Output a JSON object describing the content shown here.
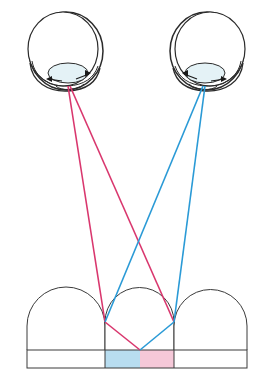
{
  "figure": {
    "background_color": "#ffffff",
    "width": 270,
    "height": 381
  },
  "colors": {
    "left_eye_ray": "#d9376e",
    "right_eye_ray": "#2a9ad6",
    "outline": "#3a3a3a",
    "eye_outline": "#2b2b2b",
    "lens_fill": "#e4f2f6",
    "left_region_fill": "#b8ddf0",
    "right_region_fill": "#f5c8d8",
    "arrow": "#1a1a1a"
  },
  "eyes": [
    {
      "id": "left-eye",
      "label": "left eye",
      "center_x": 64,
      "center_y": 50,
      "radius_x": 37,
      "radius_y": 40,
      "pupil_x": 68,
      "pupil_y": 72,
      "lens_rx": 20,
      "lens_ry": 10,
      "ray_origin_x": 68,
      "ray_origin_y": 86
    },
    {
      "id": "right-eye",
      "label": "right eye",
      "center_x": 209,
      "center_y": 50,
      "radius_x": 37,
      "radius_y": 40,
      "pupil_x": 205,
      "pupil_y": 72,
      "lens_rx": 20,
      "lens_ry": 10,
      "ray_origin_x": 205,
      "ray_origin_y": 86
    }
  ],
  "arches": [
    {
      "id": "arch-left",
      "x_left": 27,
      "x_right": 105,
      "top_y": 287,
      "wall_top_y": 326,
      "base_y": 350
    },
    {
      "id": "arch-middle",
      "x_left": 105,
      "x_right": 174,
      "top_y": 287,
      "wall_top_y": 322,
      "base_y": 350
    },
    {
      "id": "arch-right",
      "x_left": 174,
      "x_right": 247,
      "top_y": 287,
      "wall_top_y": 326,
      "base_y": 350
    }
  ],
  "base_strip": {
    "x_left": 27,
    "x_right": 247,
    "top_y": 350,
    "bottom_y": 368,
    "divider_left_x": 105,
    "divider_right_x": 174,
    "center_x": 140
  },
  "regions": [
    {
      "id": "region-blue",
      "fill": "#b8ddf0",
      "x": 105,
      "y": 350,
      "width": 35,
      "height": 18
    },
    {
      "id": "region-pink",
      "fill": "#f5c8d8",
      "x": 140,
      "y": 350,
      "width": 34,
      "height": 18
    }
  ],
  "rays": {
    "left": [
      {
        "id": "left-ray-near",
        "from_x": 68,
        "from_y": 86,
        "to_x": 105,
        "to_y": 322
      },
      {
        "id": "left-ray-far",
        "from_x": 70,
        "from_y": 86,
        "to_x": 174,
        "to_y": 322
      },
      {
        "id": "left-ray-refracted",
        "from_x": 105,
        "from_y": 322,
        "to_x": 140,
        "to_y": 350
      }
    ],
    "right": [
      {
        "id": "right-ray-near",
        "from_x": 205,
        "from_y": 86,
        "to_x": 174,
        "to_y": 322
      },
      {
        "id": "right-ray-far",
        "from_x": 203,
        "from_y": 86,
        "to_x": 105,
        "to_y": 322
      },
      {
        "id": "right-ray-refracted",
        "from_x": 174,
        "from_y": 322,
        "to_x": 140,
        "to_y": 350
      }
    ]
  },
  "annotations": {
    "convergence_point_x": 140,
    "convergence_point_y": 350,
    "left_node_x": 105,
    "left_node_y": 322,
    "right_node_x": 174,
    "right_node_y": 322
  }
}
